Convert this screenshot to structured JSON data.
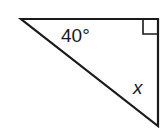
{
  "diagram": {
    "type": "right-triangle",
    "vertices": {
      "top_left": [
        21,
        19
      ],
      "top_right": [
        158,
        19
      ],
      "bottom_right": [
        158,
        126
      ]
    },
    "right_angle_vertex": "top_right",
    "angle_label": "40°",
    "unknown_label": "x",
    "stroke_color": "#1a1a1a",
    "background": "#ffffff"
  }
}
